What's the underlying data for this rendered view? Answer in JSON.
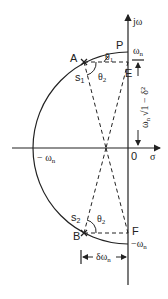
{
  "diagram": {
    "axes": {
      "imag_label": "jω",
      "real_label": "σ",
      "origin_label": "0"
    },
    "points": {
      "P": "P",
      "A": "A",
      "E": "E",
      "B": "B",
      "F": "F",
      "s1": "s",
      "s1_sub": "1",
      "s2": "s",
      "s2_sub": "2"
    },
    "angles": {
      "theta1": "θ",
      "theta1_sub": "1",
      "theta2_upper": "θ",
      "theta2_upper_sub": "2",
      "theta2_lower": "θ",
      "theta2_lower_sub": "2"
    },
    "annotations": {
      "omega_n_top": "ω",
      "omega_n_top_sub": "n",
      "minus_omega_n_left": "− ω",
      "minus_omega_n_left_sub": "n",
      "minus_omega_n_bottom": "−ω",
      "minus_omega_n_bottom_sub": "n",
      "damped_freq": "ω",
      "damped_freq_sub": "n",
      "damped_freq_rest": "√1 − δ²",
      "delta_omega": "δω",
      "delta_omega_sub": "n"
    },
    "colors": {
      "line": "#222222",
      "background": "#ffffff"
    }
  }
}
